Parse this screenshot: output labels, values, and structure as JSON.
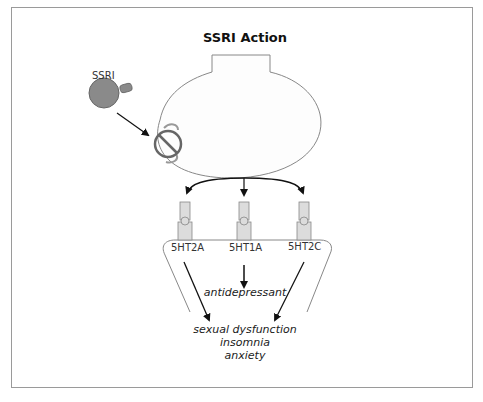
{
  "title": "SSRI Action",
  "drug": {
    "label": "SSRI",
    "color": "#8a8a8a"
  },
  "receptors": [
    {
      "label": "5HT2A"
    },
    {
      "label": "5HT1A"
    },
    {
      "label": "5HT2C"
    }
  ],
  "effects": {
    "therapeutic": "antidepressant",
    "side_effects": [
      "sexual dysfunction",
      "insomnia",
      "anxiety"
    ]
  },
  "colors": {
    "outline": "#888888",
    "arrow": "#111111",
    "receptor_fill": "#dcdcdc",
    "frame": "#9a9a9a"
  }
}
